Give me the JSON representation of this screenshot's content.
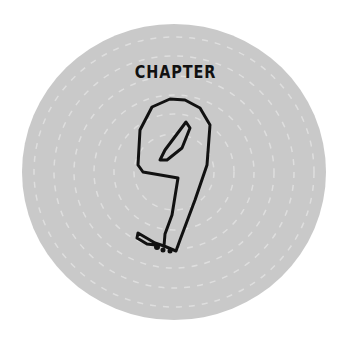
{
  "badge": {
    "label": "CHAPTER",
    "number": "9",
    "disc_color": "#c9c9c9",
    "stroke_color": "#111111"
  }
}
